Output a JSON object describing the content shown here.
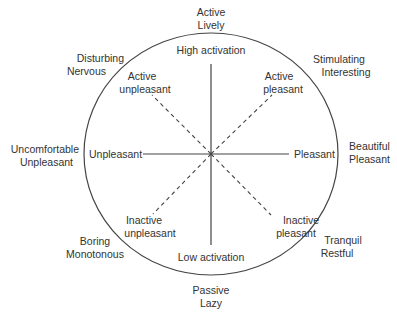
{
  "diagram": {
    "center": {
      "x": 211,
      "y": 153
    },
    "radius": {
      "rx": 127,
      "ry": 121
    },
    "colors": {
      "line": "#444444",
      "text": "#333333",
      "background": "#ffffff"
    },
    "axes": {
      "vertical": {
        "top_label": "High activation",
        "bottom_label": "Low activation",
        "style": "solid"
      },
      "horizontal": {
        "left_label": "Unpleasant",
        "right_label": "Pleasant",
        "style": "solid"
      },
      "diagonals": [
        {
          "label": "Active pleasant",
          "line1": "Active",
          "line2": "pleasant",
          "style": "dashed"
        },
        {
          "label": "Active unpleasant",
          "line1": "Active",
          "line2": "unpleasant",
          "style": "dashed"
        },
        {
          "label": "Inactive pleasant",
          "line1": "Inactive",
          "line2": "pleasant",
          "style": "dashed"
        },
        {
          "label": "Inactive unpleasant",
          "line1": "Inactive",
          "line2": "unpleasant",
          "style": "dashed"
        }
      ]
    },
    "outer_labels": {
      "top": {
        "line1": "Active",
        "line2": "Lively"
      },
      "top_right": {
        "line1": "Stimulating",
        "line2": "Interesting"
      },
      "right": {
        "line1": "Beautiful",
        "line2": "Pleasant"
      },
      "bottom_right": {
        "line1": "Tranquil",
        "line2": "Restful"
      },
      "bottom": {
        "line1": "Passive",
        "line2": "Lazy"
      },
      "bottom_left": {
        "line1": "Boring",
        "line2": "Monotonous"
      },
      "left": {
        "line1": "Uncomfortable",
        "line2": "Unpleasant"
      },
      "top_left": {
        "line1": "Disturbing",
        "line2": "Nervous"
      }
    }
  }
}
